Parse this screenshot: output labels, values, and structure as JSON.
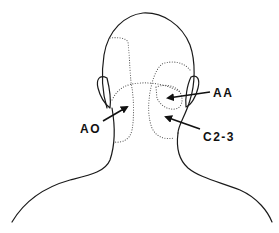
{
  "diagram": {
    "labels": {
      "ao": "AO",
      "aa": "AA",
      "c23": "C2-3"
    },
    "colors": {
      "outline": "#1a1a1a",
      "dotted_region": "#555555",
      "background": "#ffffff"
    }
  }
}
